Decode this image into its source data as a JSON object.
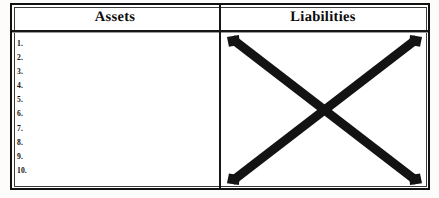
{
  "document": {
    "type": "scanned-worksheet",
    "background_color": "#fdfcfa",
    "paper_color": "#ffffff",
    "ink_color": "#131313"
  },
  "table": {
    "columns": [
      {
        "key": "assets",
        "header": "Assets"
      },
      {
        "key": "liabilities",
        "header": "Liabilities"
      }
    ],
    "assets_column": {
      "header": "Assets",
      "items": [
        {
          "number": "1."
        },
        {
          "number": "2."
        },
        {
          "number": "3."
        },
        {
          "number": "4."
        },
        {
          "number": "5."
        },
        {
          "number": "6."
        },
        {
          "number": "7."
        },
        {
          "number": "8."
        },
        {
          "number": "9."
        },
        {
          "number": "10."
        }
      ]
    },
    "liabilities_column": {
      "header": "Liabilities",
      "content": "",
      "annotation": "crossed-out-x-mark"
    }
  }
}
